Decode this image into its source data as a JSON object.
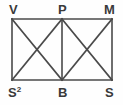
{
  "figure": {
    "type": "geometry-diagram",
    "stroke_color": "#4a4a4a",
    "background_color": "#fefefe",
    "label_color": "#3a3a3a",
    "vertices": {
      "top_left": {
        "name": "V",
        "label": "V",
        "superscript": "",
        "x": 12,
        "y": 19
      },
      "top_mid": {
        "name": "P",
        "label": "P",
        "superscript": "",
        "x": 62,
        "y": 19
      },
      "top_right": {
        "name": "M",
        "label": "M",
        "superscript": "",
        "x": 112,
        "y": 19
      },
      "bottom_left": {
        "name": "S2",
        "label": "S",
        "superscript": "2",
        "x": 12,
        "y": 80
      },
      "bottom_mid": {
        "name": "B",
        "label": "B",
        "superscript": "",
        "x": 62,
        "y": 80
      },
      "bottom_right": {
        "name": "S",
        "label": "S",
        "superscript": "",
        "x": 112,
        "y": 80
      }
    },
    "segments": [
      {
        "name": "top-edge",
        "from": "top_left",
        "to": "top_right",
        "x1": 12,
        "y1": 19,
        "x2": 112,
        "y2": 19
      },
      {
        "name": "bottom-edge",
        "from": "bottom_left",
        "to": "bottom_right",
        "x1": 12,
        "y1": 80,
        "x2": 112,
        "y2": 80
      },
      {
        "name": "left-edge",
        "from": "top_left",
        "to": "bottom_left",
        "x1": 12,
        "y1": 19,
        "x2": 12,
        "y2": 80
      },
      {
        "name": "right-edge",
        "from": "top_right",
        "to": "bottom_right",
        "x1": 112,
        "y1": 19,
        "x2": 112,
        "y2": 80
      },
      {
        "name": "mid-vertical",
        "from": "top_mid",
        "to": "bottom_mid",
        "x1": 62,
        "y1": 19,
        "x2": 62,
        "y2": 80
      },
      {
        "name": "diagonal-left-down",
        "from": "top_left",
        "to": "bottom_mid",
        "x1": 12,
        "y1": 19,
        "x2": 62,
        "y2": 80
      },
      {
        "name": "diagonal-left-up",
        "from": "bottom_left",
        "to": "top_mid",
        "x1": 12,
        "y1": 80,
        "x2": 62,
        "y2": 19
      },
      {
        "name": "diagonal-right-down",
        "from": "top_mid",
        "to": "bottom_right",
        "x1": 62,
        "y1": 19,
        "x2": 112,
        "y2": 80
      },
      {
        "name": "diagonal-right-up",
        "from": "bottom_mid",
        "to": "top_right",
        "x1": 62,
        "y1": 80,
        "x2": 112,
        "y2": 19
      }
    ]
  }
}
